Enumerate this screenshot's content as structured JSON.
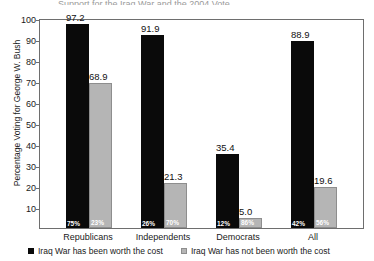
{
  "title_sliver": "Support for the Iraq War and the 2004 Vote",
  "legend": {
    "position": "bottom",
    "items": [
      {
        "label": "Iraq War has been worth the cost",
        "color": "#0a0a0a",
        "swatch": "black"
      },
      {
        "label": "Iraq War has not been worth the cost",
        "color": "#b5b5b5",
        "swatch": "gray"
      }
    ]
  },
  "axis": {
    "y_title": "Percentage Voting for George W. Bush",
    "y_ticks": [
      100,
      90,
      80,
      70,
      60,
      50,
      40,
      30,
      20,
      10
    ],
    "x_title": ""
  },
  "chart_data": {
    "type": "bar",
    "title": "Support for the Iraq War and the 2004 Vote",
    "xlabel": "",
    "ylabel": "Percentage Voting for George W. Bush",
    "ylim": [
      0,
      100
    ],
    "yticks": [
      10,
      20,
      30,
      40,
      50,
      60,
      70,
      80,
      90,
      100
    ],
    "grid": false,
    "legend_position": "bottom",
    "categories": [
      "Republicans",
      "Independents",
      "Democrats",
      "All"
    ],
    "series": [
      {
        "name": "Iraq War has been worth the cost",
        "color": "#0a0a0a",
        "values": [
          97.2,
          91.9,
          35.4,
          88.9
        ],
        "value_labels": [
          "97.2",
          "91.9",
          "35.4",
          "88.9"
        ],
        "share_labels": [
          "75%",
          "26%",
          "12%",
          "42%"
        ]
      },
      {
        "name": "Iraq War has not been worth the cost",
        "color": "#b5b5b5",
        "values": [
          68.9,
          21.3,
          5.0,
          19.6
        ],
        "value_labels": [
          "68.9",
          "21.3",
          "5.0",
          "19.6"
        ],
        "share_labels": [
          "23%",
          "70%",
          "86%",
          "56%"
        ]
      }
    ]
  }
}
